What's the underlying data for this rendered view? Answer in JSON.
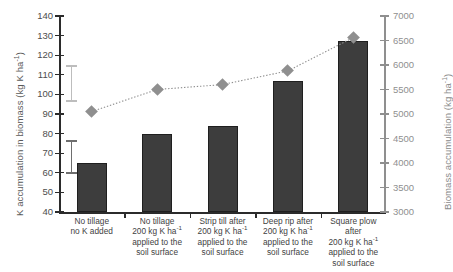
{
  "chart_data": {
    "type": "bar",
    "title": "",
    "categories": [
      "No tillage\nno K added",
      "No tillage\n200 kg K ha-1\napplied to the\nsoil surface",
      "Strip till after\n200 kg K ha-1\napplied to the\nsoil surface",
      "Deep rip after\n200 kg K ha-1\napplied to the\nsoil surface",
      "Square plow after\n200 kg K ha-1\napplied to the\nsoil surface"
    ],
    "series": [
      {
        "name": "K accumulation in biomass",
        "type": "bar",
        "axis": "left",
        "color": "#3d3d3d",
        "values": [
          65,
          80,
          84,
          107,
          127
        ]
      },
      {
        "name": "Biomass accumulation",
        "type": "line",
        "axis": "right",
        "color": "#8f8f8f",
        "marker": "diamond",
        "linestyle": "dotted",
        "values": [
          5050,
          5500,
          5600,
          5880,
          6560
        ]
      }
    ],
    "error_bars": [
      {
        "name": "biomass-lsd",
        "color": "#bdbdbd",
        "axis": "right",
        "center": 5600,
        "low": 5250,
        "high": 5990
      },
      {
        "name": "k-accumulation-lsd",
        "color": "#6e6e6e",
        "axis": "left",
        "center": 58.5,
        "low": 59.5,
        "high": 76.5
      }
    ],
    "xlabel": "",
    "ylabel": "K accumulation in biomass  (kg K ha-1)",
    "ylabel_right": "Biomass accumulation (kg ha-1)",
    "ylim": [
      40,
      140
    ],
    "ylim_right": [
      3000,
      7000
    ],
    "yticks": [
      40,
      50,
      60,
      70,
      80,
      90,
      100,
      110,
      120,
      130,
      140
    ],
    "yticks_right": [
      3000,
      3500,
      4000,
      4500,
      5000,
      5500,
      6000,
      6500,
      7000
    ],
    "grid": false,
    "legend": "none"
  },
  "axes": {
    "left_title_main": "K accumulation in biomass  (kg K ha",
    "left_title_sup": "-1",
    "left_title_end": ")",
    "right_title_main": "Biomass accumulation (kg ha",
    "right_title_sup": "-1",
    "right_title_end": ")"
  },
  "categories_parts": [
    {
      "l1": "No tillage",
      "l2": "no K added",
      "l3": "",
      "l4": "",
      "sup": ""
    },
    {
      "l1": "No tillage",
      "l2": "200 kg K ha",
      "sup": "-1",
      "l3": "applied to the",
      "l4": "soil surface"
    },
    {
      "l1": "Strip till after",
      "l2": "200 kg K ha",
      "sup": "-1",
      "l3": "applied to the",
      "l4": "soil surface"
    },
    {
      "l1": "Deep rip after",
      "l2": "200 kg K ha",
      "sup": "-1",
      "l3": "applied to the",
      "l4": "soil surface"
    },
    {
      "l1": "Square plow after",
      "l2": "200 kg K ha",
      "sup": "-1",
      "l3": "applied to the",
      "l4": "soil surface"
    }
  ]
}
